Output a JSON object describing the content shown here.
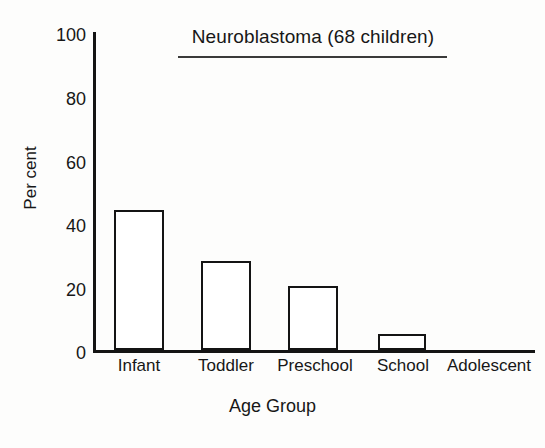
{
  "chart_data": {
    "type": "bar",
    "title": "Neuroblastoma (68 children)",
    "xlabel": "Age Group",
    "ylabel": "Per cent",
    "categories": [
      "Infant",
      "Toddler",
      "Preschool",
      "School",
      "Adolescent"
    ],
    "values": [
      44,
      28,
      20,
      5,
      0
    ],
    "ylim": [
      0,
      100
    ],
    "yticks": [
      0,
      20,
      40,
      60,
      80,
      100
    ],
    "ytick_labels": [
      "0",
      "20",
      "40",
      "60",
      "80",
      "100"
    ],
    "xlim_note": "categorical",
    "grid": false,
    "legend": "none",
    "bar_style": {
      "fill": "#ffffff",
      "edge": "#141414",
      "edge_width_px": 2.5
    },
    "axis_color": "#141414",
    "text_color": "#171717",
    "background": "#fdfdfc",
    "title_underlined": true
  },
  "axes_geometry": {
    "plot_left_px": 93,
    "plot_top_px": 32,
    "plot_bottom_px": 350,
    "plot_right_px": 535,
    "value_to_px": 3.18
  },
  "bars": [
    {
      "label": "Infant",
      "value": 44,
      "left_px": 114,
      "width_px": 50
    },
    {
      "label": "Toddler",
      "value": 28,
      "left_px": 201,
      "width_px": 50
    },
    {
      "label": "Preschool",
      "value": 20,
      "left_px": 288,
      "width_px": 50
    },
    {
      "label": "School",
      "value": 5,
      "left_px": 378,
      "width_px": 48
    },
    {
      "label": "Adolescent",
      "value": 0,
      "left_px": 464,
      "width_px": 50
    }
  ],
  "x_tick_positions": [
    {
      "label": "Infant",
      "center_px": 139
    },
    {
      "label": "Toddler",
      "center_px": 226
    },
    {
      "label": "Preschool",
      "center_px": 315
    },
    {
      "label": "School",
      "center_px": 403
    },
    {
      "label": "Adolescent",
      "center_px": 489
    }
  ],
  "y_tick_positions": [
    {
      "label": "100",
      "top_px": 26
    },
    {
      "label": "80",
      "top_px": 90
    },
    {
      "label": "60",
      "top_px": 154
    },
    {
      "label": "40",
      "top_px": 217
    },
    {
      "label": "20",
      "top_px": 281
    },
    {
      "label": "0",
      "top_px": 344
    }
  ]
}
